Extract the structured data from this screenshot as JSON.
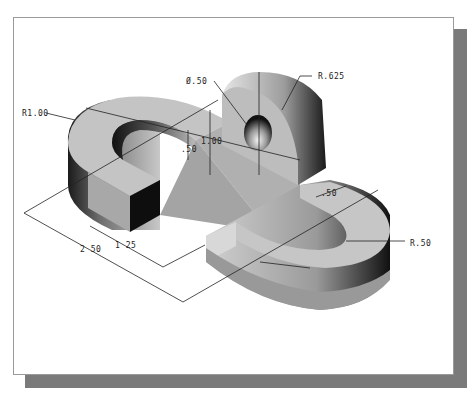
{
  "figure": {
    "type": "isometric-part-drawing",
    "colors": {
      "frame_border": "#9a9a9a",
      "shadow": "#7a7a7a",
      "background": "#ffffff",
      "dimension_line": "#222222"
    }
  },
  "dimensions": {
    "outer_radius": "R1.00",
    "hole_diameter": "Ø.50",
    "lug_radius": "R.625",
    "overall_height": "1.00",
    "base_thickness": ".50",
    "slot_width": ".50",
    "slot_radius": "R.50",
    "leg_length": "1 25",
    "overall_length": "2 50"
  }
}
